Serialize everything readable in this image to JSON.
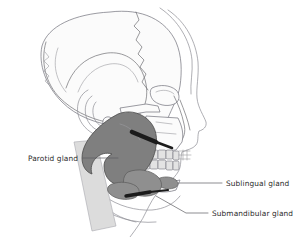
{
  "figure": {
    "background_color": "#ffffff",
    "width": 294,
    "height": 237
  },
  "colors": {
    "gland_major": "#7f7f7f",
    "gland_minor": "#8f8f8f",
    "duct": "#1b1b1b",
    "bone_outline": "#6e6e72",
    "muscle_band": "#dcdcdc",
    "tooth": "#e3e3e3",
    "leader_line": "#5d5d62",
    "label_text": "#2b2b2b"
  },
  "labels": [
    {
      "id": "parotid",
      "text": "Parotid gland",
      "side": "left",
      "text_x": 78,
      "text_y": 161,
      "leader": "M 83 158 L 118 158"
    },
    {
      "id": "sublingual",
      "text": "Sublingual gland",
      "side": "right",
      "text_x": 226,
      "text_y": 186,
      "leader": "M 222 183 L 178 183"
    },
    {
      "id": "submandibular",
      "text": "Submandibular gland",
      "side": "right",
      "text_x": 212,
      "text_y": 216,
      "leader": "M 208 213 L 186 213 L 156 196"
    }
  ],
  "structures": [
    {
      "id": "cranium",
      "name": "cranial vault",
      "kind": "bone"
    },
    {
      "id": "coronal-suture",
      "name": "coronal suture",
      "kind": "bone"
    },
    {
      "id": "lambdoid-suture",
      "name": "lambdoid suture",
      "kind": "bone"
    },
    {
      "id": "temporal-bone",
      "name": "temporal bone",
      "kind": "bone"
    },
    {
      "id": "zygomatic-arch",
      "name": "zygomatic arch",
      "kind": "bone"
    },
    {
      "id": "orbit",
      "name": "orbital rim",
      "kind": "bone"
    },
    {
      "id": "nasal-bone",
      "name": "nasal bone",
      "kind": "bone"
    },
    {
      "id": "maxilla",
      "name": "maxilla",
      "kind": "bone"
    },
    {
      "id": "mandible",
      "name": "mandible",
      "kind": "bone"
    },
    {
      "id": "upper-teeth",
      "name": "upper teeth",
      "kind": "teeth"
    },
    {
      "id": "lower-teeth",
      "name": "lower teeth",
      "kind": "teeth"
    },
    {
      "id": "external-ear",
      "name": "external ear",
      "kind": "soft"
    },
    {
      "id": "face-profile",
      "name": "facial soft tissue profile",
      "kind": "soft"
    },
    {
      "id": "neck-profile",
      "name": "neck soft tissue profile",
      "kind": "soft"
    },
    {
      "id": "sternocleidomastoid",
      "name": "sternocleidomastoid muscle",
      "kind": "muscle"
    },
    {
      "id": "parotid-gland",
      "name": "parotid gland",
      "kind": "gland"
    },
    {
      "id": "parotid-duct",
      "name": "parotid duct",
      "kind": "duct"
    },
    {
      "id": "sublingual-gland",
      "name": "sublingual gland",
      "kind": "gland"
    },
    {
      "id": "submandibular-gland",
      "name": "submandibular gland",
      "kind": "gland"
    },
    {
      "id": "submandibular-duct",
      "name": "submandibular duct",
      "kind": "duct"
    }
  ]
}
